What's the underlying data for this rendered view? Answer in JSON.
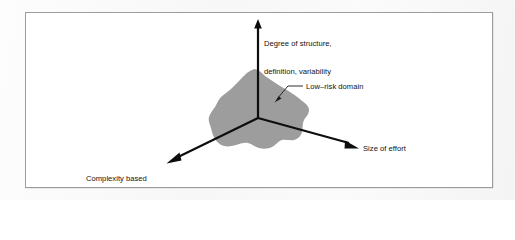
{
  "figure": {
    "kind": "three-axis-conceptual-diagram",
    "frame_border_color": "#9c9c9c",
    "background_color": "#ffffff"
  },
  "axes": [
    {
      "id": "vertical",
      "direction": "up",
      "label_lines": [
        "Degree of structure,",
        "definition, variability"
      ],
      "label_text": "Degree of structure, definition, variability",
      "arrow": true
    },
    {
      "id": "lower-left",
      "direction": "down-left",
      "label_lines": [
        "Complexity based",
        "on past efforts"
      ],
      "label_text": "Complexity based on past efforts",
      "arrow": true
    },
    {
      "id": "lower-right",
      "direction": "down-right",
      "label_lines": [
        "Size of effort"
      ],
      "label_text": "Size of effort",
      "arrow": true
    }
  ],
  "region": {
    "label": "Low–risk domain",
    "fill_color": "#9d9d9d",
    "shape": "irregular-rounded-blob",
    "callout": true
  },
  "labels": {
    "vertical_axis_line1": "Degree of structure,",
    "vertical_axis_line2": "definition, variability",
    "low_risk_domain": "Low–risk domain",
    "complexity_line1": "Complexity based",
    "complexity_line2": "on past efforts",
    "size_of_effort": "Size of effort"
  },
  "colors": {
    "axis": "#0d0d0d",
    "blob": "#9d9d9d",
    "frame": "#9c9c9c",
    "text": "#121212",
    "paper": "#f7f7f7"
  }
}
